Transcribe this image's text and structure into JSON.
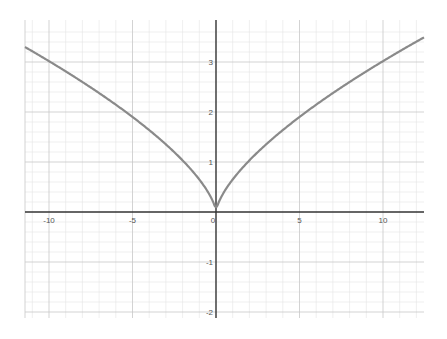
{
  "chart_data": {
    "type": "line",
    "title": "",
    "xlabel": "",
    "ylabel": "",
    "xlim": [
      -11.5,
      12.5
    ],
    "ylim": [
      -2.1,
      3.8
    ],
    "grid": true,
    "legend": null,
    "x_ticks": [
      -10,
      -5,
      0,
      5,
      10
    ],
    "y_ticks": [
      -2,
      -1,
      1,
      2,
      3
    ],
    "x_tick_labels": [
      "-10",
      "-5",
      "0",
      "5",
      "10"
    ],
    "y_tick_labels": [
      "-2",
      "-1",
      "1",
      "2",
      "3"
    ],
    "series": [
      {
        "name": "y = c·|x|^(2/3)",
        "color": "#8a8a8a",
        "x": [
          -11.5,
          -10,
          -7.5,
          -5,
          -2.5,
          -1,
          0,
          1,
          2.5,
          5,
          7.5,
          10,
          12.5
        ],
        "y": [
          3.3,
          3.0,
          2.48,
          1.9,
          1.2,
          0.65,
          0,
          0.65,
          1.2,
          1.9,
          2.48,
          3.0,
          3.5
        ]
      }
    ]
  },
  "colors": {
    "axis": "#333333",
    "major_grid": "#c8c8c8",
    "minor_grid": "#e4e4e4",
    "curve": "#8a8a8a"
  }
}
